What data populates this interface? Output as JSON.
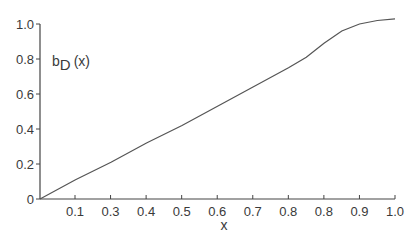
{
  "chart_data": {
    "type": "line",
    "title": "",
    "xlabel": "x",
    "ylabel": "b_D (x)",
    "ylabel_parts": {
      "base": "b",
      "sub": "D",
      "arg": "(x)"
    },
    "x_tick_labels": [
      "0.1",
      "0.3",
      "0.4",
      "0.5",
      "0.6",
      "0.7",
      "0.8",
      "0.8",
      "0.9",
      "1.0"
    ],
    "y_tick_labels": [
      "0",
      "0.2",
      "0.4",
      "0.6",
      "0.8",
      "1.0"
    ],
    "y_ticks": [
      0,
      0.2,
      0.4,
      0.6,
      0.8,
      1.0
    ],
    "ylim": [
      0,
      1.0
    ],
    "xlim": [
      0,
      1.0
    ],
    "grid": false,
    "legend": null,
    "series": [
      {
        "name": "b_D(x)",
        "x": [
          0.0,
          0.1,
          0.2,
          0.3,
          0.4,
          0.5,
          0.6,
          0.7,
          0.75,
          0.8,
          0.85,
          0.9,
          0.95,
          1.0
        ],
        "values": [
          0.0,
          0.11,
          0.21,
          0.32,
          0.42,
          0.53,
          0.64,
          0.75,
          0.81,
          0.89,
          0.96,
          1.0,
          1.02,
          1.03
        ]
      }
    ],
    "colors": {
      "line": "#555555",
      "axis": "#444444",
      "text": "#3a3a3a"
    }
  }
}
